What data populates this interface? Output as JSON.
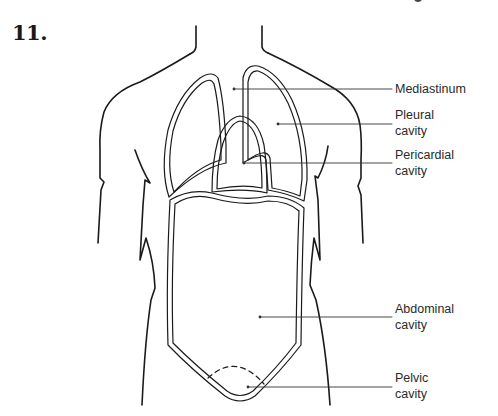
{
  "figure": {
    "number": "11.",
    "title_fragment_visible": true
  },
  "labels": [
    {
      "id": "mediastinum",
      "lines": [
        "Mediastinum"
      ]
    },
    {
      "id": "pleural",
      "lines": [
        "Pleural",
        "cavity"
      ]
    },
    {
      "id": "pericardial",
      "lines": [
        "Pericardial",
        "cavity"
      ]
    },
    {
      "id": "abdominal",
      "lines": [
        "Abdominal",
        "cavity"
      ]
    },
    {
      "id": "pelvic",
      "lines": [
        "Pelvic",
        "cavity"
      ]
    }
  ],
  "colors": {
    "stroke": "#1a1a1a",
    "leader": "#333333",
    "text": "#2a2a2a",
    "background": "#ffffff"
  }
}
